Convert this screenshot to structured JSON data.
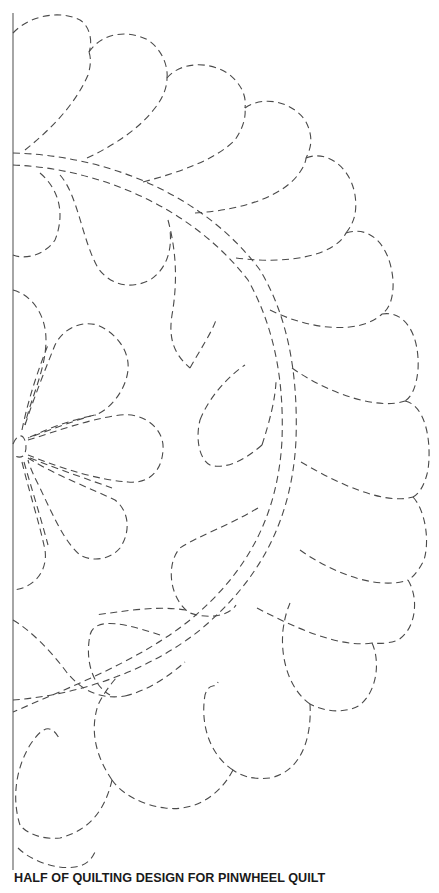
{
  "document": {
    "caption": "HALF OF QUILTING DESIGN FOR PINWHEEL QUILT",
    "line_color": "#4a4a4a",
    "background": "#ffffff"
  },
  "pattern": {
    "icon": "dashed-quilting-stencil",
    "elements": [
      "outer-feather-scallops",
      "double-arc-spine",
      "inner-feather-plumes",
      "center-flower-petals",
      "left-margin-rule"
    ]
  }
}
